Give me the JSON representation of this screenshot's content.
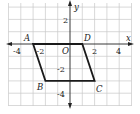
{
  "figure": {
    "type": "coordinate-plane",
    "axes": {
      "x_label": "x",
      "y_label": "y",
      "origin_label": "O"
    },
    "x_ticks": [
      "-4",
      "-2",
      "2",
      "4"
    ],
    "y_ticks": [
      "2",
      "-2",
      "-4"
    ],
    "grid": {
      "x_range": [
        -5,
        5
      ],
      "y_range": [
        -5,
        3.4
      ]
    },
    "shape": {
      "name": "parallelogram ABCD",
      "vertices": [
        {
          "label": "A",
          "x": -3,
          "y": 0
        },
        {
          "label": "B",
          "x": -2,
          "y": -3
        },
        {
          "label": "C",
          "x": 2,
          "y": -3
        },
        {
          "label": "D",
          "x": 1,
          "y": 0
        }
      ]
    }
  }
}
